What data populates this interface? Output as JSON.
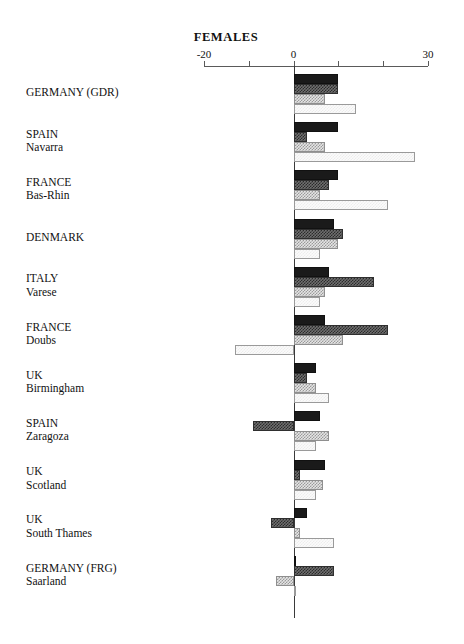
{
  "chart_data": {
    "type": "bar",
    "orientation": "horizontal",
    "title": "FEMALES",
    "xlabel": "",
    "ylabel": "",
    "xlim": [
      -20,
      30
    ],
    "grid": false,
    "legend": "none",
    "tick_labels": [
      "-20",
      "0",
      "30"
    ],
    "tick_values": [
      -20,
      -10,
      0,
      10,
      20,
      30
    ],
    "categories": [
      "GERMANY (GDR)",
      "SPAIN Navarra",
      "FRANCE Bas-Rhin",
      "DENMARK",
      "ITALY Varese",
      "FRANCE Doubs",
      "UK Birmingham",
      "SPAIN Zaragoza",
      "UK Scotland",
      "UK South Thames",
      "GERMANY (FRG) Saarland"
    ],
    "series": [
      {
        "name": "series-1",
        "style": "solid-black",
        "values": [
          10,
          10,
          10,
          9,
          8,
          7,
          5,
          6,
          7,
          3,
          0.5
        ]
      },
      {
        "name": "series-2",
        "style": "dark-checker",
        "values": [
          10,
          3,
          8,
          11,
          18,
          21,
          3,
          -9,
          1.5,
          -5,
          9
        ]
      },
      {
        "name": "series-3",
        "style": "light-checker",
        "values": [
          7,
          7,
          6,
          10,
          7,
          11,
          5,
          8,
          6.5,
          1.5,
          -4
        ]
      },
      {
        "name": "series-4",
        "style": "white",
        "values": [
          14,
          27,
          21,
          6,
          6,
          -13,
          8,
          5,
          5,
          9,
          0.5
        ]
      }
    ]
  },
  "categories_display": [
    {
      "line1": "GERMANY (GDR)",
      "line2": ""
    },
    {
      "line1": "SPAIN",
      "line2": "Navarra"
    },
    {
      "line1": "FRANCE",
      "line2": "Bas-Rhin"
    },
    {
      "line1": "DENMARK",
      "line2": ""
    },
    {
      "line1": "ITALY",
      "line2": "Varese"
    },
    {
      "line1": "FRANCE",
      "line2": "Doubs"
    },
    {
      "line1": "UK",
      "line2": "Birmingham"
    },
    {
      "line1": "SPAIN",
      "line2": "Zaragoza"
    },
    {
      "line1": "UK",
      "line2": "Scotland"
    },
    {
      "line1": "UK",
      "line2": "South Thames"
    },
    {
      "line1": "GERMANY (FRG)",
      "line2": "Saarland"
    }
  ],
  "axis": {
    "left_label": "-20",
    "zero_label": "0",
    "right_label": "30"
  },
  "colors": {
    "series_1": "#1a1a1a",
    "series_2": "#6f6f6f",
    "series_3": "#e4e4e4",
    "series_4": "#fbfbfb",
    "axis": "#5a5a5a",
    "text": "#111111",
    "background": "#ffffff"
  }
}
